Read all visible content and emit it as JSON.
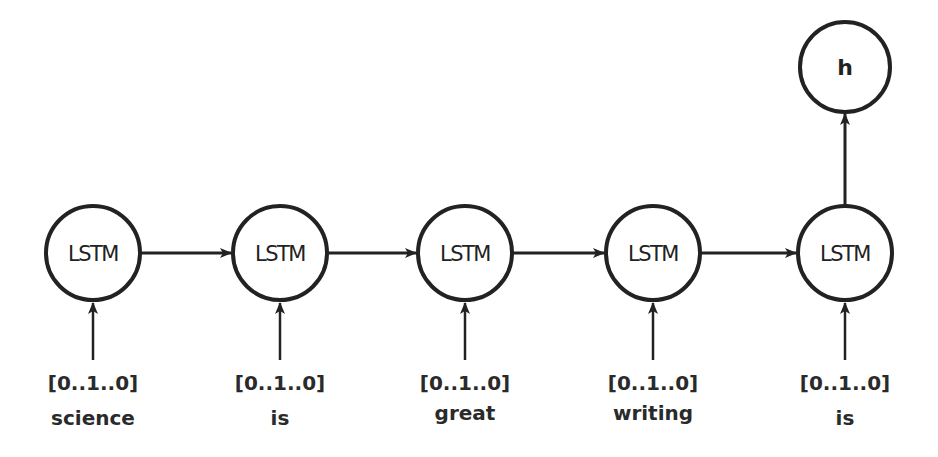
{
  "diagram": {
    "title": "",
    "nodes": [
      {
        "id": "lstm1",
        "label": "LSTM",
        "vector": "[0..1..0]",
        "word": "science"
      },
      {
        "id": "lstm2",
        "label": "LSTM",
        "vector": "[0..1..0]",
        "word": "is"
      },
      {
        "id": "lstm3",
        "label": "LSTM",
        "vector": "[0..1..0]",
        "word": "great"
      },
      {
        "id": "lstm4",
        "label": "LSTM",
        "vector": "[0..1..0]",
        "word": "writing"
      },
      {
        "id": "lstm5",
        "label": "LSTM",
        "vector": "[0..1..0]",
        "word": "is"
      }
    ],
    "output_node": {
      "id": "h",
      "label": "h"
    },
    "edges": [
      {
        "from": "lstm1",
        "to": "lstm2"
      },
      {
        "from": "lstm2",
        "to": "lstm3"
      },
      {
        "from": "lstm3",
        "to": "lstm4"
      },
      {
        "from": "lstm4",
        "to": "lstm5"
      },
      {
        "from": "lstm5",
        "to": "h"
      },
      {
        "from": "input1",
        "to": "lstm1"
      },
      {
        "from": "input2",
        "to": "lstm2"
      },
      {
        "from": "input3",
        "to": "lstm3"
      },
      {
        "from": "input4",
        "to": "lstm4"
      },
      {
        "from": "input5",
        "to": "lstm5"
      }
    ],
    "colors": {
      "stroke": "#222222",
      "background": "#ffffff"
    }
  }
}
